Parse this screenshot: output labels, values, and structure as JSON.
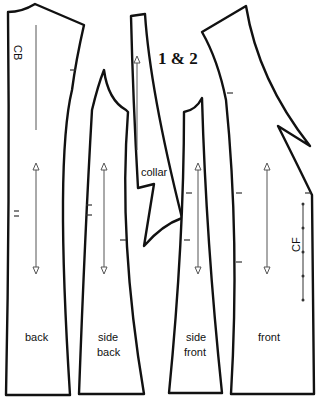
{
  "diagram": {
    "title": "1 & 2",
    "pieces": {
      "back": {
        "label": "back",
        "marker": "CB"
      },
      "side_back": {
        "label_line1": "side",
        "label_line2": "back"
      },
      "collar": {
        "label": "collar"
      },
      "side_front": {
        "label_line1": "side",
        "label_line2": "front"
      },
      "front": {
        "label": "front",
        "marker": "CF"
      }
    },
    "colors": {
      "outline": "#111111",
      "grainline": "#555555",
      "background": "#ffffff"
    }
  }
}
